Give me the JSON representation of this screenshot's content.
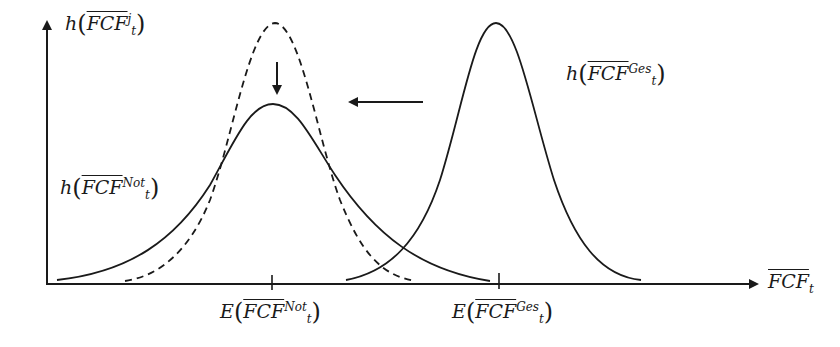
{
  "diagram": {
    "y_axis_label": {
      "func": "h",
      "var": "FCF",
      "sub": "t",
      "sup": "j"
    },
    "x_axis_label": {
      "var": "FCF",
      "sub": "t"
    },
    "curve_labels": {
      "ges": {
        "func": "h",
        "var": "FCF",
        "sub": "t",
        "sup": "Ges"
      },
      "not": {
        "func": "h",
        "var": "FCF",
        "sub": "t",
        "sup": "Not"
      }
    },
    "tick_labels": {
      "not": {
        "func": "E",
        "var": "FCF",
        "sub": "t",
        "sup": "Not"
      },
      "ges": {
        "func": "E",
        "var": "FCF",
        "sub": "t",
        "sup": "Ges"
      }
    },
    "curves": [
      {
        "name": "dashed-reference-density",
        "style": "dashed",
        "mean_x": 275,
        "peak_y": 23
      },
      {
        "name": "not-density",
        "style": "solid",
        "mean_x": 273,
        "peak_y": 104
      },
      {
        "name": "ges-density",
        "style": "solid",
        "mean_x": 496,
        "peak_y": 23
      }
    ],
    "arrows": [
      {
        "name": "down-arrow",
        "meaning": "peak lowers"
      },
      {
        "name": "left-arrow",
        "meaning": "distribution shifts left"
      }
    ],
    "colors": {
      "line": "#1a1a1a",
      "background": "#ffffff"
    }
  }
}
